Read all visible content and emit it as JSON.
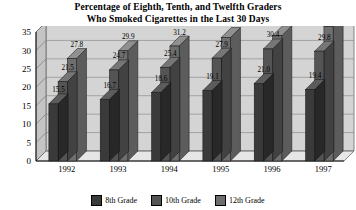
{
  "chart_data": {
    "type": "bar",
    "title": "Percentage of Eighth, Tenth, and Twelfth Graders Who Smoked Cigarettes in the Last 30 Days",
    "title_line1": "Percentage of Eighth, Tenth, and Twelfth Graders",
    "title_line2": "Who Smoked Cigarettes in the Last 30 Days",
    "xlabel": "",
    "ylabel": "",
    "categories": [
      "1992",
      "1993",
      "1994",
      "1995",
      "1996",
      "1997"
    ],
    "series": [
      {
        "name": "8th Grade",
        "values": [
          15.5,
          16.7,
          18.6,
          19.1,
          21.0,
          19.4
        ],
        "color": "#3a3a3a"
      },
      {
        "name": "10th Grade",
        "values": [
          21.5,
          24.7,
          25.4,
          27.9,
          30.4,
          29.8
        ],
        "color": "#545454"
      },
      {
        "name": "12th Grade",
        "values": [
          27.8,
          29.9,
          31.2,
          33.5,
          34.0,
          36.5
        ],
        "color": "#6e6e6e"
      }
    ],
    "ylim": [
      0,
      35
    ],
    "yticks": [
      "0",
      "5",
      "10",
      "15",
      "20",
      "25",
      "30",
      "35"
    ],
    "ytick_values": [
      0,
      5,
      10,
      15,
      20,
      25,
      30,
      35
    ],
    "grid": true,
    "legend_position": "bottom",
    "plot_background": "#d4d4d4",
    "gridline_color": "#8c8c8c",
    "style": "3d-clustered-column"
  },
  "legend": {
    "items": [
      {
        "label": "8th Grade",
        "color": "#3a3a3a"
      },
      {
        "label": "10th Grade",
        "color": "#545454"
      },
      {
        "label": "12th Grade",
        "color": "#6e6e6e"
      }
    ]
  }
}
